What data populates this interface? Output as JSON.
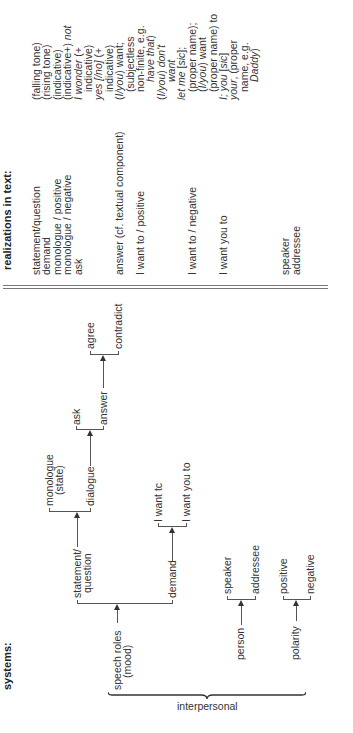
{
  "systems": {
    "header": "systems:",
    "metafunction": "interpersonal",
    "nodes": {
      "speech_roles": [
        "speech roles",
        "(mood)"
      ],
      "person": "person",
      "polarity": "polarity",
      "statement_question": [
        "statement/",
        "question"
      ],
      "demand": "demand",
      "speaker": "speaker",
      "addressee": "addressee",
      "positive": "positive",
      "negative": "negative",
      "monologue": [
        "monologue",
        "(state)"
      ],
      "dialogue": "dialogue",
      "ask": "ask",
      "answer": "answer",
      "agree": "agree",
      "contradict": "contradict",
      "i_want_to": "I want tc",
      "i_want_you_to": "I want you to"
    }
  },
  "realizations": {
    "header": "realizations in text:",
    "column1": [
      "statement/question",
      "demand",
      "monologue / positive",
      "monologue / negative",
      "ask",
      "",
      "",
      "",
      "answer (cf. textual component)",
      "",
      "I want to / positive",
      "",
      "",
      "",
      "",
      "I want to / negative",
      "",
      "",
      "I want you to",
      "",
      "",
      "",
      "",
      "",
      "speaker",
      "addressee"
    ],
    "column2": [
      {
        "parts": [
          {
            "t": "(falling tone)",
            "i": false
          }
        ]
      },
      {
        "parts": [
          {
            "t": "(rising tone)",
            "i": false
          }
        ]
      },
      {
        "parts": [
          {
            "t": "(indicative)",
            "i": false
          }
        ]
      },
      {
        "parts": [
          {
            "t": "(indicative+) ",
            "i": false
          },
          {
            "t": "not",
            "i": true
          }
        ]
      },
      {
        "parts": [
          {
            "t": "I wonder",
            "i": true
          },
          {
            "t": " (+",
            "i": false
          }
        ]
      },
      {
        "indent": true,
        "parts": [
          {
            "t": "indicative)",
            "i": false
          }
        ]
      },
      {
        "parts": [
          {
            "t": "yes [/no]",
            "i": true
          },
          {
            "t": " (+",
            "i": false
          }
        ]
      },
      {
        "indent": true,
        "parts": [
          {
            "t": "indicative)",
            "i": false
          }
        ]
      },
      {
        "parts": [
          {
            "t": "(",
            "i": false
          },
          {
            "t": "I/you",
            "i": true
          },
          {
            "t": ") want;",
            "i": false
          }
        ]
      },
      {
        "indent": true,
        "parts": [
          {
            "t": "(subjectless",
            "i": false
          }
        ]
      },
      {
        "indent": true,
        "parts": [
          {
            "t": "non-finite, e.g.",
            "i": false
          }
        ]
      },
      {
        "indent2": true,
        "parts": [
          {
            "t": "have that",
            "i": true
          },
          {
            "t": ")",
            "i": false
          }
        ]
      },
      {
        "parts": [
          {
            "t": "(",
            "i": false
          },
          {
            "t": "I/you",
            "i": true
          },
          {
            "t": ") ",
            "i": false
          },
          {
            "t": "don't",
            "i": true
          }
        ]
      },
      {
        "indent2": true,
        "parts": [
          {
            "t": "want",
            "i": true
          }
        ]
      },
      {
        "parts": [
          {
            "t": "let me",
            "i": true
          },
          {
            "t": " [",
            "i": false
          },
          {
            "t": "sic",
            "i": true
          },
          {
            "t": "];",
            "i": false
          }
        ]
      },
      {
        "indent": true,
        "parts": [
          {
            "t": "(proper name);",
            "i": false
          }
        ]
      },
      {
        "indent": true,
        "parts": [
          {
            "t": "(",
            "i": false
          },
          {
            "t": "I/you",
            "i": true
          },
          {
            "t": ") want",
            "i": false
          }
        ]
      },
      {
        "indent": true,
        "parts": [
          {
            "t": "(proper name) to",
            "i": false
          }
        ]
      },
      {
        "parts": [
          {
            "t": "I; you",
            "i": true
          },
          {
            "t": " [",
            "i": false
          },
          {
            "t": "sic",
            "i": true
          },
          {
            "t": "]",
            "i": false
          }
        ]
      },
      {
        "parts": [
          {
            "t": "your",
            "i": true
          },
          {
            "t": ", (proper",
            "i": false
          }
        ]
      },
      {
        "indent": true,
        "parts": [
          {
            "t": "name, e.g.",
            "i": false
          }
        ]
      },
      {
        "indent2": true,
        "parts": [
          {
            "t": "Daddy",
            "i": true
          },
          {
            "t": ")",
            "i": false
          }
        ]
      }
    ]
  }
}
